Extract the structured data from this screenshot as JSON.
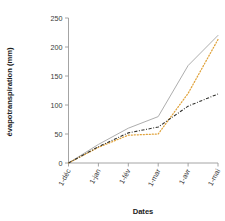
{
  "chart_data": {
    "type": "line",
    "title": "",
    "subtitle": "",
    "xlabel": "Dates",
    "ylabel": "évapotranspiration (mm)",
    "x": [
      "1-déc",
      "1-jan",
      "1-fév",
      "1-mar",
      "1-avr",
      "1-mai"
    ],
    "xtick_labels": [
      "1-déc",
      "1-jan",
      "1-fév",
      "1-mar",
      "1-avr",
      "1-mai"
    ],
    "ytick_labels": [
      "0",
      "50",
      "100",
      "150",
      "200",
      "250"
    ],
    "ytick_values": [
      0,
      50,
      100,
      150,
      200,
      250
    ],
    "ylim": [
      0,
      250
    ],
    "grid": false,
    "legend": "none",
    "series": [
      {
        "name": "series-solid",
        "style": "solid",
        "color": "#a9a9a9",
        "values": [
          0,
          32,
          60,
          80,
          168,
          220
        ]
      },
      {
        "name": "series-dotted",
        "style": "dotted",
        "color": "#e0a33c",
        "values": [
          0,
          27,
          48,
          50,
          120,
          213
        ]
      },
      {
        "name": "series-dashdot",
        "style": "dash-dot",
        "color": "#30302c",
        "values": [
          0,
          28,
          52,
          62,
          98,
          119
        ]
      }
    ]
  },
  "axes": {
    "x_title": "Dates",
    "y_title": "évapotranspiration (mm)"
  }
}
